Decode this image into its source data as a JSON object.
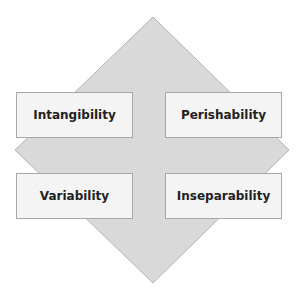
{
  "diagram": {
    "shape": "diamond",
    "fill_color": "#d9d9d9",
    "stroke_color": "#b0b0b0",
    "box_fill": "#f4f4f4",
    "boxes": [
      {
        "label": "Intangibility",
        "position": "top-left"
      },
      {
        "label": "Perishability",
        "position": "top-right"
      },
      {
        "label": "Variability",
        "position": "bottom-left"
      },
      {
        "label": "Inseparability",
        "position": "bottom-right"
      }
    ]
  }
}
